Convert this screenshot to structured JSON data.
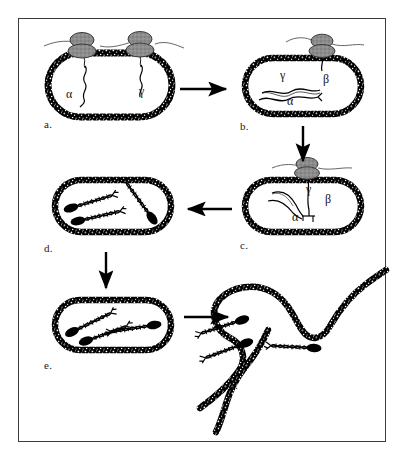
{
  "figure": {
    "domain_type": "diagram",
    "title_visible": "",
    "background_color": "#ffffff",
    "border_color": "#3b3b3b",
    "ink_color": "#000000",
    "phage_head_fill": "#8c8c8c",
    "width": 409,
    "height": 469
  },
  "panels": [
    {
      "id": "a",
      "label": "a.",
      "label_x": 48,
      "label_y": 124,
      "cell_cx": 110,
      "cell_cy": 85,
      "cell_rx": 62,
      "cell_ry": 32,
      "description": "bacterial cell with two phage particles adsorbed on top, injecting DNA strands",
      "greek_labels": [
        {
          "symbol": "α",
          "x": 70,
          "y": 95
        },
        {
          "symbol": "γ",
          "x": 143,
          "y": 92
        }
      ],
      "phages": [
        {
          "x": 80,
          "y": 46
        },
        {
          "x": 136,
          "y": 45
        }
      ]
    },
    {
      "id": "b",
      "label": "b.",
      "label_x": 243,
      "label_y": 126,
      "cell_cx": 302,
      "cell_cy": 85,
      "cell_rx": 58,
      "cell_ry": 28,
      "description": "cell with one phage attached injecting beta DNA; gamma and alpha strands free inside",
      "greek_labels": [
        {
          "symbol": "β",
          "x": 327,
          "y": 80
        },
        {
          "symbol": "γ",
          "x": 283,
          "y": 76
        },
        {
          "symbol": "α",
          "x": 290,
          "y": 101
        }
      ],
      "phages": [
        {
          "x": 321,
          "y": 48
        }
      ]
    },
    {
      "id": "c",
      "label": "c.",
      "label_x": 243,
      "label_y": 245,
      "cell_cx": 302,
      "cell_cy": 205,
      "cell_rx": 58,
      "cell_ry": 28,
      "description": "cell with phage attached, beta strand pairing with alpha and gamma strands inside",
      "greek_labels": [
        {
          "symbol": "β",
          "x": 329,
          "y": 200
        },
        {
          "symbol": "γ",
          "x": 310,
          "y": 190
        },
        {
          "symbol": "α",
          "x": 296,
          "y": 217
        }
      ],
      "phages": [
        {
          "x": 306,
          "y": 168
        }
      ]
    },
    {
      "id": "d",
      "label": "d.",
      "label_x": 48,
      "label_y": 248,
      "cell_cx": 113,
      "cell_cy": 205,
      "cell_rx": 58,
      "cell_ry": 28,
      "description": "cell containing three recombined twisted DNA duplexes with dark end caps",
      "greek_labels": [],
      "phages": []
    },
    {
      "id": "e",
      "label": "e.",
      "label_x": 48,
      "label_y": 365,
      "cell_cx": 113,
      "cell_cy": 325,
      "cell_rx": 58,
      "cell_ry": 26,
      "description": "cell containing recombined twisted DNA duplexes prior to lysis",
      "greek_labels": [],
      "phages": []
    },
    {
      "id": "f",
      "label": "f.",
      "label_x": 234,
      "label_y": 385,
      "cell_cx": 298,
      "cell_cy": 335,
      "cell_rx": 0,
      "cell_ry": 0,
      "description": "lysed cell, membrane unravelled into an open looping strand releasing the recombined DNA duplexes",
      "greek_labels": [],
      "phages": []
    }
  ],
  "arrows": [
    {
      "id": "a-to-b",
      "direction": "right",
      "x1": 180,
      "y1": 89,
      "x2": 228,
      "y2": 89
    },
    {
      "id": "b-to-c",
      "direction": "down",
      "x1": 303,
      "y1": 126,
      "x2": 303,
      "y2": 163
    },
    {
      "id": "c-to-d",
      "direction": "left",
      "x1": 232,
      "y1": 209,
      "x2": 186,
      "y2": 209
    },
    {
      "id": "d-to-e",
      "direction": "down",
      "x1": 106,
      "y1": 252,
      "x2": 106,
      "y2": 290
    },
    {
      "id": "e-to-f",
      "direction": "right",
      "x1": 184,
      "y1": 317,
      "x2": 230,
      "y2": 317
    }
  ],
  "legend": {
    "greek_symbols": [
      "α",
      "β",
      "γ"
    ],
    "panel_letters": [
      "a.",
      "b.",
      "c.",
      "d.",
      "e.",
      "f."
    ]
  }
}
